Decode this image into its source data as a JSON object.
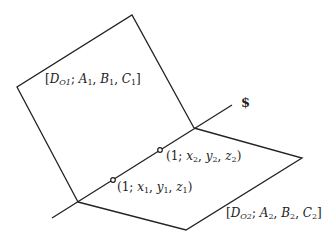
{
  "diagram": {
    "type": "two intersecting planes",
    "colors": {
      "stroke": "#222222",
      "background": "#ffffff"
    },
    "planes": [
      {
        "id": "plane-1",
        "label_parts": {
          "open": "[",
          "D": "D",
          "D_sub": "O1",
          "sep": ";",
          "A": "A",
          "A_sub": "1",
          "B": "B",
          "B_sub": "1",
          "C": "C",
          "C_sub": "1",
          "close": "]"
        },
        "label": "[D_O1; A1, B1, C1]",
        "points": [
          [
            132,
            15
          ],
          [
            17,
            87
          ],
          [
            78,
            202
          ],
          [
            194,
            128
          ]
        ]
      },
      {
        "id": "plane-2",
        "label_parts": {
          "open": "[",
          "D": "D",
          "D_sub": "O2",
          "sep": ";",
          "A": "A",
          "A_sub": "2",
          "B": "B",
          "B_sub": "2",
          "C": "C",
          "C_sub": "2",
          "close": "]"
        },
        "label": "[D_O2; A2, B2, C2]",
        "points": [
          [
            78,
            202
          ],
          [
            194,
            128
          ],
          [
            302,
            158
          ],
          [
            186,
            230
          ]
        ]
      }
    ],
    "line": {
      "label": "$",
      "from": [
        52,
        218
      ],
      "to": [
        232,
        105
      ]
    },
    "points": [
      {
        "id": "point-1",
        "label": "(1; x1, y1, z1)",
        "label_parts": {
          "open": "(1;",
          "x": "x",
          "x_sub": "1",
          "y": "y",
          "y_sub": "1",
          "z": "z",
          "z_sub": "1",
          "close": ")"
        },
        "at": [
          113,
          180
        ]
      },
      {
        "id": "point-2",
        "label": "(1; x2, y2, z2)",
        "label_parts": {
          "open": "(1;",
          "x": "x",
          "x_sub": "2",
          "y": "y",
          "y_sub": "2",
          "z": "z",
          "z_sub": "2",
          "close": ")"
        },
        "at": [
          160,
          150
        ]
      }
    ]
  }
}
